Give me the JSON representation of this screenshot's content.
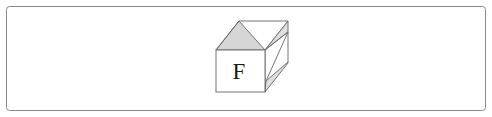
{
  "figure": {
    "name": "cube-diagram",
    "background_color": "#ffffff",
    "border": {
      "stroke_color": "#8a8a8a",
      "stroke_width": 1,
      "corner_radius": 3,
      "x": 6,
      "y": 6,
      "width": 479,
      "height": 104
    },
    "cube": {
      "label": "F",
      "label_position": {
        "x": 239,
        "y": 79
      },
      "outline_color": "#555555",
      "front_face_color": "#ffffff",
      "shade_color": "#d6d6d6",
      "shade_color_light": "#e2e2e2",
      "vertices": {
        "front_top_left": {
          "x": 216,
          "y": 50
        },
        "front_top_right": {
          "x": 265,
          "y": 50
        },
        "front_bottom_left": {
          "x": 216,
          "y": 92
        },
        "front_bottom_right": {
          "x": 265,
          "y": 92
        },
        "back_top_left": {
          "x": 239,
          "y": 21
        },
        "back_top_right": {
          "x": 288,
          "y": 21
        },
        "back_bottom_right": {
          "x": 288,
          "y": 63
        }
      },
      "top_face_shaded_triangle": [
        {
          "x": 216,
          "y": 50
        },
        {
          "x": 265,
          "y": 50
        },
        {
          "x": 239,
          "y": 21
        }
      ],
      "right_face_inner_parallelogram": [
        {
          "x": 265,
          "y": 50
        },
        {
          "x": 288,
          "y": 21
        },
        {
          "x": 288,
          "y": 63
        },
        {
          "x": 265,
          "y": 92
        }
      ],
      "right_face_shade_upper": [
        {
          "x": 265,
          "y": 50
        },
        {
          "x": 288,
          "y": 21
        },
        {
          "x": 288,
          "y": 31
        }
      ],
      "right_face_shade_lower": [
        {
          "x": 265,
          "y": 82
        },
        {
          "x": 288,
          "y": 63
        },
        {
          "x": 265,
          "y": 92
        }
      ]
    }
  }
}
